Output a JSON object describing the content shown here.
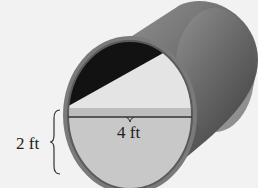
{
  "diagram": {
    "labels": {
      "width": "4 ft",
      "depth": "2 ft"
    },
    "colors": {
      "background": "#f2f2f2",
      "pipe_outer": "#6e6e6e",
      "pipe_rim": "#8a8a8a",
      "interior_dark": "#111111",
      "interior_light": "#e6e6e6",
      "water_surface": "#bdbdbd",
      "water_front": "#c8c8c8",
      "line": "#333333"
    }
  }
}
